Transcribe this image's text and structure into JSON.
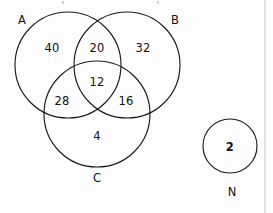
{
  "diagram": {
    "type": "venn-diagram",
    "title": "",
    "sets": [
      {
        "id": "A",
        "label": "A",
        "label_x": 22,
        "label_y": 20,
        "cx": 68,
        "cy": 65,
        "r": 53
      },
      {
        "id": "B",
        "label": "B",
        "label_x": 175,
        "label_y": 20,
        "cx": 127,
        "cy": 65,
        "r": 53
      },
      {
        "id": "C",
        "label": "C",
        "label_x": 97,
        "label_y": 178,
        "cx": 97,
        "cy": 114,
        "r": 53
      }
    ],
    "universal": {
      "id": "N",
      "label": "N",
      "label_x": 232,
      "label_y": 192,
      "cx": 230,
      "cy": 146,
      "r": 27,
      "value": "2",
      "value_x": 230,
      "value_y": 147,
      "emphasis": true
    },
    "regions": [
      {
        "id": "A-only",
        "value": "40",
        "x": 52,
        "y": 48,
        "emphasis": false
      },
      {
        "id": "A-and-B",
        "value": "20",
        "x": 97,
        "y": 48,
        "emphasis": false
      },
      {
        "id": "B-only",
        "value": "32",
        "x": 143,
        "y": 48,
        "emphasis": false
      },
      {
        "id": "A-B-C",
        "value": "12",
        "x": 97,
        "y": 82,
        "emphasis": false
      },
      {
        "id": "A-and-C",
        "value": "28",
        "x": 62,
        "y": 101,
        "emphasis": false
      },
      {
        "id": "B-and-C",
        "value": "16",
        "x": 126,
        "y": 101,
        "emphasis": false
      },
      {
        "id": "C-only",
        "value": "4",
        "x": 97,
        "y": 136,
        "emphasis": false
      }
    ],
    "page_rule": {
      "x": 265,
      "y1": 0,
      "y2": 213
    },
    "colors": {
      "stroke": "#1a1a1a",
      "text": "#111111",
      "background": "#fdfdfd",
      "rule": "#b9b9b9"
    }
  }
}
